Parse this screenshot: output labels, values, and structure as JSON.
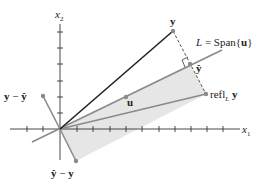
{
  "diagram": {
    "axes": {
      "x1_label": "x",
      "x1_sub": "1",
      "x2_label": "x",
      "x2_sub": "2"
    },
    "labels": {
      "y": "y",
      "y_hat": "ŷ",
      "u": "u",
      "L_prefix": "L",
      "L_eq": " = Span{",
      "L_u": "u",
      "L_close": "}",
      "refl_text": "refl",
      "refl_sub": "L",
      "refl_y": " y",
      "y_minus_yhat_a": "y",
      "y_minus_yhat_op": " − ",
      "y_minus_yhat_b": "ŷ",
      "yhat_minus_y_a": "ŷ",
      "yhat_minus_y_op": " − ",
      "yhat_minus_y_b": "y"
    },
    "colors": {
      "axis": "#333333",
      "vector_y": "#222222",
      "line_L": "#8a8a8a",
      "shaded": "#e6e6e6",
      "point": "#8a8a8a",
      "dashed": "#555555"
    }
  }
}
